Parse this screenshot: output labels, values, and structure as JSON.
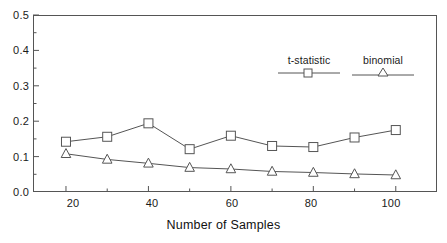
{
  "chart_data": {
    "type": "line",
    "title": "",
    "xlabel": "Number of Samples",
    "ylabel": "",
    "x": [
      20,
      30,
      40,
      50,
      60,
      70,
      80,
      90,
      100
    ],
    "series": [
      {
        "name": "t-statistic",
        "marker": "square",
        "values": [
          0.142,
          0.156,
          0.194,
          0.121,
          0.159,
          0.13,
          0.127,
          0.154,
          0.175
        ]
      },
      {
        "name": "binomial",
        "marker": "triangle",
        "values": [
          0.108,
          0.092,
          0.081,
          0.069,
          0.065,
          0.058,
          0.055,
          0.051,
          0.048
        ]
      }
    ],
    "xlim": [
      12,
      110
    ],
    "ylim": [
      0.0,
      0.5
    ],
    "xticks_major": [
      20,
      40,
      60,
      80,
      100
    ],
    "xticks_minor": [
      30,
      50,
      70,
      90
    ],
    "yticks_major": [
      "0.0",
      "0.1",
      "0.2",
      "0.3",
      "0.4",
      "0.5"
    ],
    "yticks_major_values": [
      0.0,
      0.1,
      0.2,
      0.3,
      0.4,
      0.5
    ],
    "yticks_minor_values": [
      0.05,
      0.15,
      0.25,
      0.35,
      0.45
    ],
    "grid": false,
    "legend_position": "top-right-inside",
    "line_color": "#555555",
    "marker_color": "#555555",
    "axis_color": "#555555",
    "text_color": "#1a1a1a"
  },
  "legend": {
    "items": [
      {
        "label": "t-statistic",
        "marker": "square"
      },
      {
        "label": "binomial",
        "marker": "triangle"
      }
    ]
  },
  "axes": {
    "x_title": "Number of Samples",
    "x_tick_labels": [
      "20",
      "40",
      "60",
      "80",
      "100"
    ],
    "y_tick_labels": [
      "0.5",
      "0.4",
      "0.3",
      "0.2",
      "0.1",
      "0.0"
    ]
  }
}
